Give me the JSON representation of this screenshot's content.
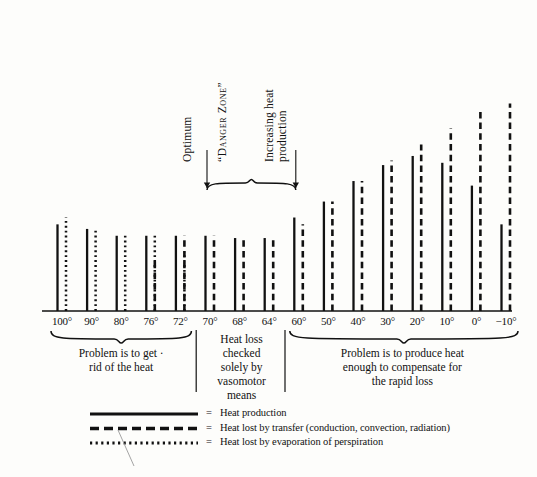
{
  "chart_data": {
    "type": "bar",
    "title": "",
    "xlabel": "",
    "ylabel": "",
    "grid": false,
    "legend_position": "bottom-left",
    "categories": [
      "100°",
      "90°",
      "80°",
      "76°",
      "72°",
      "70°",
      "68°",
      "64°",
      "60°",
      "50°",
      "40°",
      "30°",
      "20°",
      "10°",
      "0°",
      "−10°"
    ],
    "axis_note": "Environmental temperature in degrees Fahrenheit, decreasing left to right",
    "ylim": [
      0,
      100
    ],
    "series": [
      {
        "name": "Heat production",
        "style": "solid",
        "values": [
          38,
          36,
          33,
          33,
          33,
          33,
          32,
          32,
          41,
          48,
          57,
          64,
          68,
          65,
          55,
          38
        ]
      },
      {
        "name": "Heat lost by transfer (conduction, convection, radiation)",
        "style": "dashed",
        "values": [
          0,
          0,
          0,
          22,
          33,
          33,
          32,
          32,
          38,
          48,
          57,
          66,
          73,
          80,
          88,
          91
        ]
      },
      {
        "name": "Heat lost by evaporation of perspiration",
        "style": "dotted",
        "values": [
          41,
          36,
          33,
          33,
          26,
          0,
          0,
          0,
          0,
          0,
          0,
          0,
          0,
          0,
          0,
          0
        ]
      }
    ]
  },
  "annotations": {
    "optimum": "Optimum",
    "danger_zone": "“Danger Zone”",
    "increasing": "Increasing heat\nproduction",
    "increasing_line1": "Increasing heat",
    "increasing_line2": "production"
  },
  "regions": [
    {
      "id": "warm",
      "caption_lines": [
        "Problem is to get ·",
        "rid of the heat"
      ],
      "from": "100°",
      "to": "72°"
    },
    {
      "id": "neutral",
      "caption_lines": [
        "Heat loss",
        "checked",
        "solely by",
        "vasomotor",
        "means"
      ],
      "from": "70°",
      "to": "64°"
    },
    {
      "id": "cold",
      "caption_lines": [
        "Problem is to produce heat",
        "enough to compensate for",
        "the rapid loss"
      ],
      "from": "60°",
      "to": "−10°"
    }
  ],
  "legend": {
    "equals": "=",
    "items": [
      {
        "style": "solid",
        "label": "Heat production"
      },
      {
        "style": "dashed",
        "label": "Heat lost by transfer (conduction, convection, radiation)"
      },
      {
        "style": "dotted",
        "label": "Heat lost by evaporation of perspiration"
      }
    ]
  },
  "colors": {
    "ink": "#111111",
    "paper": "#fdfdfb",
    "bleed": "#e9e7e2"
  },
  "bleed_through": [
    "",
    ""
  ]
}
